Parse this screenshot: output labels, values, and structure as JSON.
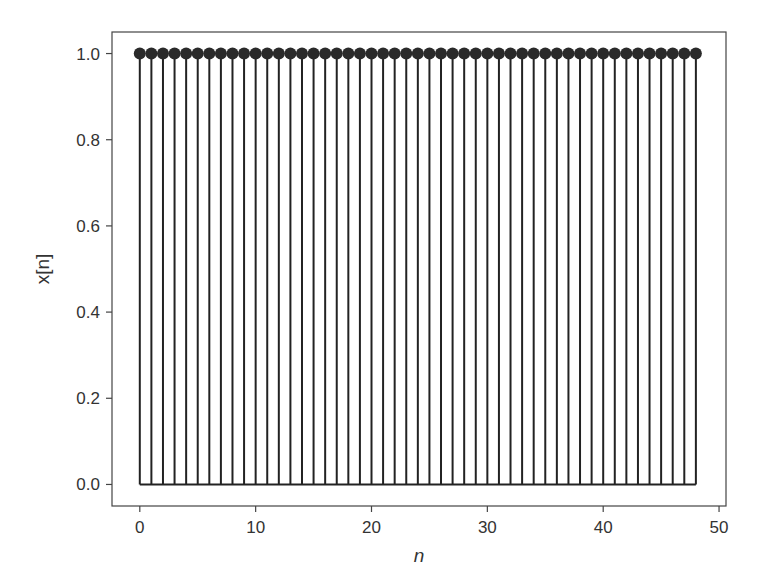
{
  "chart_data": {
    "type": "stem",
    "title": "",
    "xlabel": "n",
    "ylabel": "x[n]",
    "xlim": [
      -2.4,
      50.6
    ],
    "ylim": [
      -0.05,
      1.05
    ],
    "xticks": [
      0,
      10,
      20,
      30,
      40,
      50
    ],
    "xtick_labels": [
      "0",
      "10",
      "20",
      "30",
      "40",
      "50"
    ],
    "yticks": [
      0.0,
      0.2,
      0.4,
      0.6,
      0.8,
      1.0
    ],
    "ytick_labels": [
      "0.0",
      "0.2",
      "0.4",
      "0.6",
      "0.8",
      "1.0"
    ],
    "grid": false,
    "legend": null,
    "baseline": 0,
    "x": [
      0,
      1,
      2,
      3,
      4,
      5,
      6,
      7,
      8,
      9,
      10,
      11,
      12,
      13,
      14,
      15,
      16,
      17,
      18,
      19,
      20,
      21,
      22,
      23,
      24,
      25,
      26,
      27,
      28,
      29,
      30,
      31,
      32,
      33,
      34,
      35,
      36,
      37,
      38,
      39,
      40,
      41,
      42,
      43,
      44,
      45,
      46,
      47,
      48
    ],
    "values": [
      1,
      1,
      1,
      1,
      1,
      1,
      1,
      1,
      1,
      1,
      1,
      1,
      1,
      1,
      1,
      1,
      1,
      1,
      1,
      1,
      1,
      1,
      1,
      1,
      1,
      1,
      1,
      1,
      1,
      1,
      1,
      1,
      1,
      1,
      1,
      1,
      1,
      1,
      1,
      1,
      1,
      1,
      1,
      1,
      1,
      1,
      1,
      1,
      1
    ],
    "colors": {
      "stem": "#222222",
      "marker": "#2a2a2a",
      "axes": "#444444",
      "text": "#333333"
    }
  }
}
